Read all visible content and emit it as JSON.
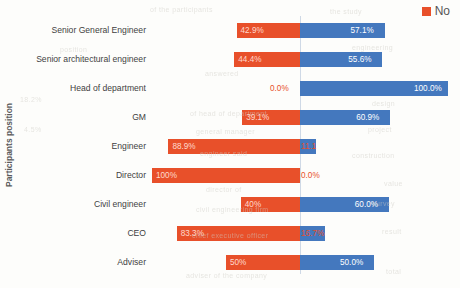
{
  "chart_data": {
    "type": "bar",
    "subtype": "diverging-stacked-horizontal",
    "title": "",
    "xlabel": "",
    "ylabel": "Participants position",
    "grid": false,
    "legend_position": "top-right",
    "axis_center": 0,
    "xlim": [
      -100,
      100
    ],
    "categories": [
      "Senior General Engineer",
      "Senior architectural engineer",
      "Head of department",
      "GM",
      "Engineer",
      "Director",
      "Civil engineer",
      "CEO",
      "Adviser"
    ],
    "series": [
      {
        "name": "No",
        "color": "#E8502A",
        "direction": "left",
        "values": [
          42.9,
          44.4,
          0.0,
          39.1,
          88.9,
          100,
          40,
          83.3,
          50
        ],
        "labels": [
          "42.9%",
          "44.4%",
          "0.0%",
          "39.1%",
          "88.9%",
          "100%",
          "40%",
          "83.3%",
          "50%"
        ]
      },
      {
        "name": "Yes",
        "color": "#4478BE",
        "direction": "right",
        "values": [
          57.1,
          55.6,
          100.0,
          60.9,
          11.1,
          0.0,
          60.0,
          16.7,
          50.0
        ],
        "labels": [
          "57.1%",
          "55.6%",
          "100.0%",
          "60.9%",
          "11.1",
          "0.0%",
          "60.0%",
          "16.7%",
          "50.0%"
        ]
      }
    ]
  },
  "legend": {
    "entries": [
      {
        "label": "No",
        "color": "#E8502A"
      }
    ]
  },
  "axis": {
    "y_title": "Participants position"
  },
  "scan_artifacts": [
    {
      "text": "of the participants",
      "x": 150,
      "y": 6
    },
    {
      "text": "the study",
      "x": 330,
      "y": 8
    },
    {
      "text": "position",
      "x": 60,
      "y": 46
    },
    {
      "text": "engineering",
      "x": 352,
      "y": 44
    },
    {
      "text": "answered",
      "x": 205,
      "y": 70
    },
    {
      "text": "18.2%",
      "x": 20,
      "y": 96
    },
    {
      "text": "of head of department",
      "x": 190,
      "y": 110
    },
    {
      "text": "design",
      "x": 372,
      "y": 100
    },
    {
      "text": "4.5%",
      "x": 24,
      "y": 126
    },
    {
      "text": "general manager",
      "x": 196,
      "y": 128
    },
    {
      "text": "project",
      "x": 368,
      "y": 126
    },
    {
      "text": "engineer said",
      "x": 200,
      "y": 150
    },
    {
      "text": "construction",
      "x": 352,
      "y": 152
    },
    {
      "text": "director of",
      "x": 206,
      "y": 186
    },
    {
      "text": "value",
      "x": 384,
      "y": 180
    },
    {
      "text": "civil engineering firm",
      "x": 196,
      "y": 206
    },
    {
      "text": "survey",
      "x": 372,
      "y": 200
    },
    {
      "text": "chief executive officer",
      "x": 192,
      "y": 232
    },
    {
      "text": "result",
      "x": 382,
      "y": 228
    },
    {
      "text": "adviser of the company",
      "x": 186,
      "y": 272
    },
    {
      "text": "total",
      "x": 386,
      "y": 268
    }
  ]
}
